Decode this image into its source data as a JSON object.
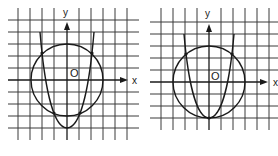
{
  "figure": {
    "colors": {
      "ink": "#1a1a1a",
      "grid": "#3a3a3a",
      "background": "#ffffff"
    }
  },
  "graphs": [
    {
      "id": "left",
      "x_axis_label": "x",
      "y_axis_label": "y",
      "origin_label": "O",
      "shapes": [
        "circle",
        "parabola"
      ],
      "intersections": 4
    },
    {
      "id": "right",
      "x_axis_label": "x",
      "y_axis_label": "y",
      "origin_label": "O",
      "shapes": [
        "circle",
        "parabola"
      ],
      "intersections": 3
    }
  ]
}
